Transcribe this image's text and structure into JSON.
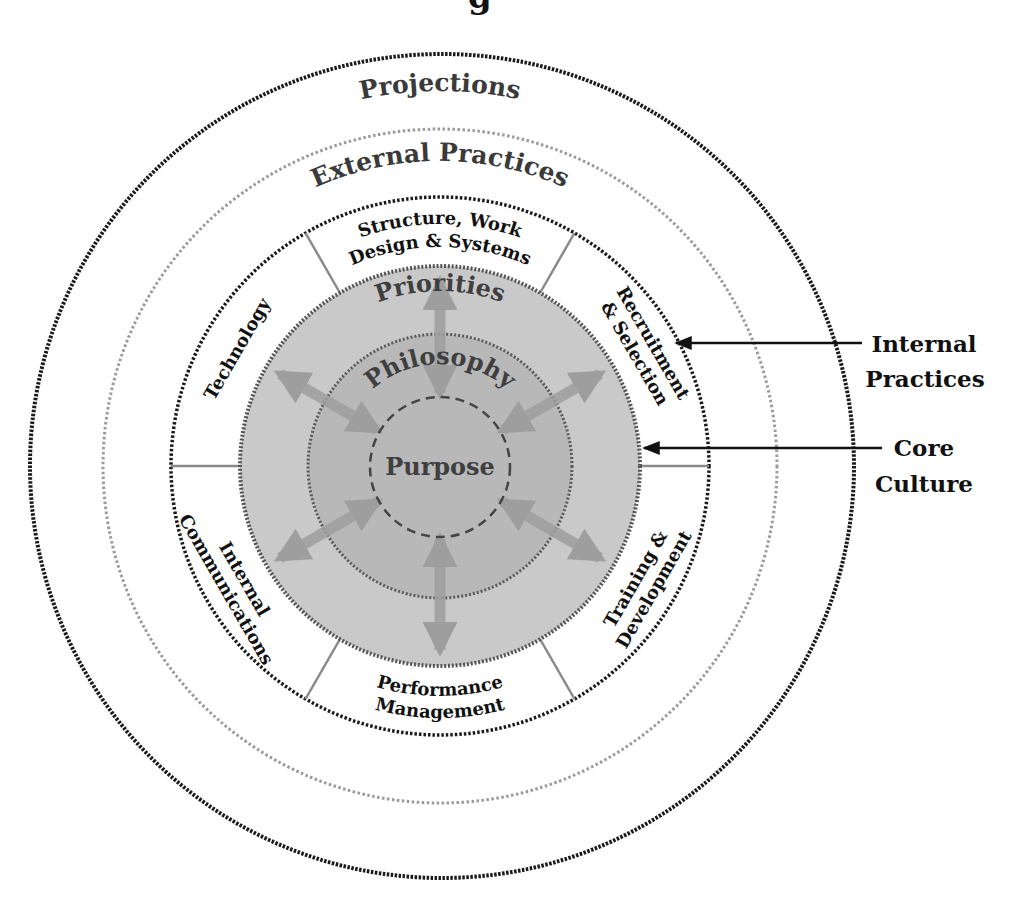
{
  "top_cropped_text": "g",
  "rings": {
    "projections": {
      "label": "Projections"
    },
    "external_practices": {
      "label": "External Practices"
    },
    "internal_practices": {
      "segments": [
        {
          "id": "structure",
          "lines": [
            "Structure, Work",
            "Design & Systems"
          ]
        },
        {
          "id": "recruitment",
          "lines": [
            "Recruitment",
            "& Selection"
          ]
        },
        {
          "id": "training",
          "lines": [
            "Training &",
            "Development"
          ]
        },
        {
          "id": "performance",
          "lines": [
            "Performance",
            "Management"
          ]
        },
        {
          "id": "communications",
          "lines": [
            "Internal",
            "Communications"
          ]
        },
        {
          "id": "technology",
          "lines": [
            "Technology"
          ]
        }
      ]
    },
    "core": {
      "priorities": "Priorities",
      "philosophy": "Philosophy",
      "purpose": "Purpose"
    }
  },
  "callouts": {
    "internal_practices": {
      "line1": "Internal",
      "line2": "Practices"
    },
    "core_culture": {
      "line1": "Core",
      "line2": "Culture"
    }
  },
  "colors": {
    "outer_ring_stroke": "#1a1a1a",
    "external_ring_stroke": "#9a9a9a",
    "core_fill": "#c9c9c9",
    "philosophy_fill": "#b6b6b6",
    "arrow": "#9e9e9e",
    "text": "#111111"
  }
}
